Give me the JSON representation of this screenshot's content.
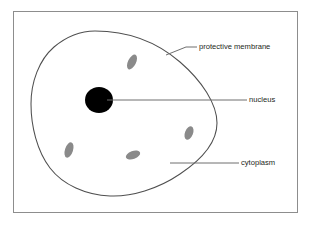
{
  "diagram": {
    "frame": {
      "border_color": "#8d8d8d",
      "background_color": "#ffffff"
    },
    "colors": {
      "outline": "#4f4f4f",
      "nucleus_fill": "#000000",
      "organelle_fill": "#8a8a8a",
      "leader_line": "#6e6e6e",
      "text": "#231f20"
    },
    "labels": [
      {
        "id": "protective-membrane",
        "text": "protective membrane",
        "text_x": 199,
        "text_y": 47,
        "leader": "M 166,55 L 186,47 L 197,47"
      },
      {
        "id": "nucleus",
        "text": "nucleus",
        "text_x": 249,
        "text_y": 100,
        "leader": "M 107,100 L 247,100"
      },
      {
        "id": "cytoplasm",
        "text": "cytoplasm",
        "text_x": 241,
        "text_y": 163,
        "leader": "M 170,163 L 239,163"
      }
    ],
    "nucleus": {
      "cx": 99,
      "cy": 100,
      "rx": 14,
      "ry": 13
    },
    "organelles": [
      {
        "id": "organelle-top",
        "cx": 132,
        "cy": 62,
        "rx": 4.0,
        "ry": 8.0,
        "rotate": 26
      },
      {
        "id": "organelle-left-lower",
        "cx": 69,
        "cy": 150,
        "rx": 4.0,
        "ry": 8.0,
        "rotate": 18
      },
      {
        "id": "organelle-bottom-mid",
        "cx": 133,
        "cy": 155,
        "rx": 7.5,
        "ry": 4.0,
        "rotate": -20
      },
      {
        "id": "organelle-right",
        "cx": 189,
        "cy": 133,
        "rx": 4.0,
        "ry": 7.0,
        "rotate": 22
      }
    ]
  }
}
